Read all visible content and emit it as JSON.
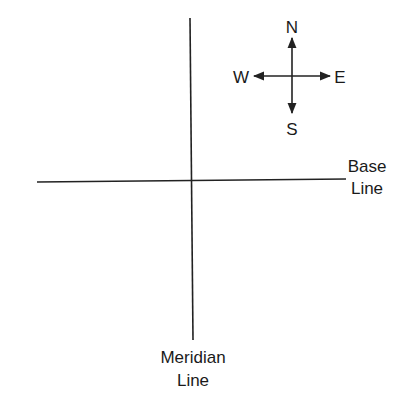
{
  "diagram": {
    "compass": {
      "north_label": "N",
      "south_label": "S",
      "east_label": "E",
      "west_label": "W"
    },
    "base_line": {
      "label_line1": "Base",
      "label_line2": "Line"
    },
    "meridian_line": {
      "label_line1": "Meridian",
      "label_line2": "Line"
    },
    "colors": {
      "ink": "#222222",
      "background": "#ffffff"
    }
  }
}
